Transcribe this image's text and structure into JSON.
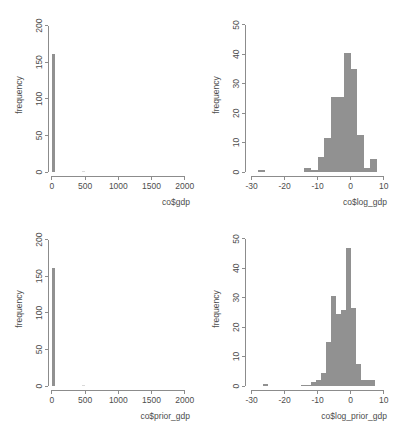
{
  "figure": {
    "background_color": "#ffffff",
    "bar_color": "#919191",
    "axis_color": "#8c8c8c",
    "text_color": "#4d4d4d",
    "panel_count": 4,
    "layout": "2x2"
  },
  "chart_data": [
    {
      "id": "hist-gdp",
      "position": "top-left",
      "type": "bar",
      "subtype": "histogram",
      "title": "",
      "xlabel": "co$gdp",
      "ylabel": "frequency",
      "xlim": [
        -60,
        2080
      ],
      "ylim": [
        0,
        205
      ],
      "xticks": [
        0,
        500,
        1000,
        1500,
        2000
      ],
      "xtick_labels": [
        "0",
        "500",
        "1000",
        "1500",
        "2000"
      ],
      "yticks": [
        0,
        50,
        100,
        150,
        200
      ],
      "ytick_labels": [
        "0",
        "50",
        "100",
        "150",
        "200"
      ],
      "grid": false,
      "legend": false,
      "bin_width": 50,
      "bin_starts": [
        0,
        450
      ],
      "categories": [
        "0-50",
        "450-500"
      ],
      "values": [
        161,
        1
      ]
    },
    {
      "id": "hist-log-gdp",
      "position": "top-right",
      "type": "bar",
      "subtype": "histogram",
      "title": "",
      "xlabel": "co$log_gdp",
      "ylabel": "frequency",
      "xlim": [
        -32,
        11
      ],
      "ylim": [
        0,
        51
      ],
      "xticks": [
        -30,
        -20,
        -10,
        0,
        10
      ],
      "xtick_labels": [
        "-30",
        "-20",
        "-10",
        "0",
        "10"
      ],
      "yticks": [
        0,
        10,
        20,
        30,
        40,
        50
      ],
      "ytick_labels": [
        "0",
        "10",
        "20",
        "30",
        "40",
        "50"
      ],
      "grid": false,
      "legend": false,
      "bin_width": 2,
      "bin_starts": [
        -28,
        -14,
        -12,
        -10,
        -8,
        -6,
        -4,
        -2,
        0,
        2,
        4,
        6
      ],
      "categories": [
        "-28 to -26",
        "-14 to -12",
        "-12 to -10",
        "-10 to -8",
        "-8 to -6",
        "-6 to -4",
        "-4 to -2",
        "-2 to 0",
        "0 to 2",
        "2 to 4",
        "4 to 6",
        "6 to 8"
      ],
      "values": [
        0.6,
        1.5,
        0.6,
        5,
        11.5,
        25.5,
        25.5,
        40.5,
        35,
        12.5,
        1.5,
        4.5
      ]
    },
    {
      "id": "hist-prior-gdp",
      "position": "bottom-left",
      "type": "bar",
      "subtype": "histogram",
      "title": "",
      "xlabel": "co$prior_gdp",
      "ylabel": "frequency",
      "xlim": [
        -60,
        2080
      ],
      "ylim": [
        0,
        205
      ],
      "xticks": [
        0,
        500,
        1000,
        1500,
        2000
      ],
      "xtick_labels": [
        "0",
        "500",
        "1000",
        "1500",
        "2000"
      ],
      "yticks": [
        0,
        50,
        100,
        150,
        200
      ],
      "ytick_labels": [
        "0",
        "50",
        "100",
        "150",
        "200"
      ],
      "grid": false,
      "legend": false,
      "bin_width": 50,
      "bin_starts": [
        0,
        450
      ],
      "categories": [
        "0-50",
        "450-500"
      ],
      "values": [
        161,
        1
      ]
    },
    {
      "id": "hist-log-prior-gdp",
      "position": "bottom-right",
      "type": "bar",
      "subtype": "histogram",
      "title": "",
      "xlabel": "co$log_prior_gdp",
      "ylabel": "frequency",
      "xlim": [
        -32,
        11
      ],
      "ylim": [
        0,
        51
      ],
      "xticks": [
        -30,
        -20,
        -10,
        0,
        10
      ],
      "xtick_labels": [
        "-30",
        "-20",
        "-10",
        "0",
        "10"
      ],
      "yticks": [
        0,
        10,
        20,
        30,
        40,
        50
      ],
      "ytick_labels": [
        "0",
        "10",
        "20",
        "30",
        "40",
        "50"
      ],
      "grid": false,
      "legend": false,
      "bin_width": 1.5,
      "bin_starts": [
        -26.5,
        -15,
        -13.5,
        -12,
        -10.5,
        -9,
        -7.5,
        -6,
        -4.5,
        -3,
        -1.5,
        0,
        1.5,
        3,
        4.5,
        6
      ],
      "categories": [
        "-26.5 to -25",
        "-15 to -13.5",
        "-13.5 to -12",
        "-12 to -10.5",
        "-10.5 to -9",
        "-9 to -7.5",
        "-7.5 to -6",
        "-6 to -4.5",
        "-4.5 to -3",
        "-3 to -1.5",
        "-1.5 to 0",
        "0 to 1.5",
        "1.5 to 3",
        "3 to 4.5",
        "4.5 to 6",
        "6 to 7.5"
      ],
      "values": [
        0.8,
        0.5,
        0.5,
        1.5,
        2,
        4.5,
        15,
        30.5,
        24.5,
        26,
        47,
        26.5,
        7.5,
        2,
        2,
        2
      ]
    }
  ]
}
